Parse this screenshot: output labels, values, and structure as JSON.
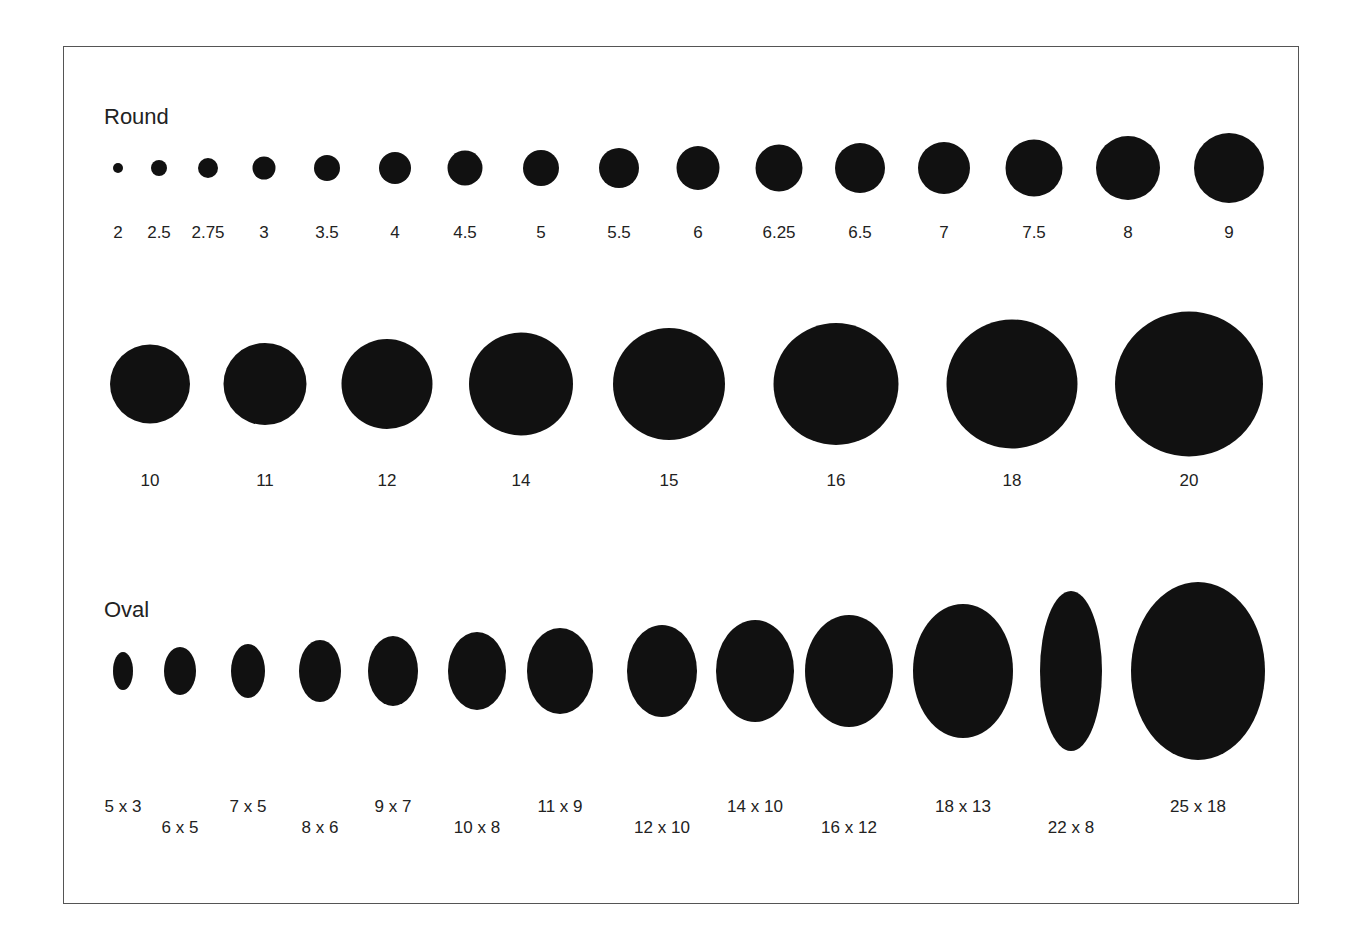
{
  "sections": {
    "round": {
      "title": "Round",
      "row1": [
        {
          "label": "2",
          "x": 118,
          "w": 10,
          "h": 10
        },
        {
          "label": "2.5",
          "x": 159,
          "w": 16,
          "h": 16
        },
        {
          "label": "2.75",
          "x": 208,
          "w": 20,
          "h": 20
        },
        {
          "label": "3",
          "x": 264,
          "w": 23,
          "h": 23
        },
        {
          "label": "3.5",
          "x": 327,
          "w": 26,
          "h": 26
        },
        {
          "label": "4",
          "x": 395,
          "w": 32,
          "h": 32
        },
        {
          "label": "4.5",
          "x": 465,
          "w": 35,
          "h": 35
        },
        {
          "label": "5",
          "x": 541,
          "w": 36,
          "h": 36
        },
        {
          "label": "5.5",
          "x": 619,
          "w": 40,
          "h": 40
        },
        {
          "label": "6",
          "x": 698,
          "w": 43,
          "h": 44
        },
        {
          "label": "6.25",
          "x": 779,
          "w": 47,
          "h": 47
        },
        {
          "label": "6.5",
          "x": 860,
          "w": 50,
          "h": 50
        },
        {
          "label": "7",
          "x": 944,
          "w": 52,
          "h": 52
        },
        {
          "label": "7.5",
          "x": 1034,
          "w": 57,
          "h": 57
        },
        {
          "label": "8",
          "x": 1128,
          "w": 64,
          "h": 64
        },
        {
          "label": "9",
          "x": 1229,
          "w": 70,
          "h": 70
        }
      ],
      "row2": [
        {
          "label": "10",
          "x": 150,
          "w": 80,
          "h": 79
        },
        {
          "label": "11",
          "x": 265,
          "w": 83,
          "h": 82
        },
        {
          "label": "12",
          "x": 387,
          "w": 91,
          "h": 90
        },
        {
          "label": "14",
          "x": 521,
          "w": 104,
          "h": 103
        },
        {
          "label": "15",
          "x": 669,
          "w": 112,
          "h": 112
        },
        {
          "label": "16",
          "x": 836,
          "w": 125,
          "h": 122
        },
        {
          "label": "18",
          "x": 1012,
          "w": 131,
          "h": 129
        },
        {
          "label": "20",
          "x": 1189,
          "w": 148,
          "h": 145
        }
      ]
    },
    "oval": {
      "title": "Oval",
      "items": [
        {
          "label": "5 x 3",
          "x": 123,
          "w": 20,
          "h": 38,
          "ly": 797
        },
        {
          "label": "6 x 5",
          "x": 180,
          "w": 32,
          "h": 48,
          "ly": 818
        },
        {
          "label": "7 x 5",
          "x": 248,
          "w": 34,
          "h": 54,
          "ly": 797
        },
        {
          "label": "8 x 6",
          "x": 320,
          "w": 42,
          "h": 62,
          "ly": 818
        },
        {
          "label": "9 x 7",
          "x": 393,
          "w": 50,
          "h": 70,
          "ly": 797
        },
        {
          "label": "10 x 8",
          "x": 477,
          "w": 58,
          "h": 78,
          "ly": 818
        },
        {
          "label": "11 x 9",
          "x": 560,
          "w": 66,
          "h": 86,
          "ly": 797
        },
        {
          "label": "12 x 10",
          "x": 662,
          "w": 70,
          "h": 92,
          "ly": 818
        },
        {
          "label": "14 x 10",
          "x": 755,
          "w": 78,
          "h": 102,
          "ly": 797
        },
        {
          "label": "16 x 12",
          "x": 849,
          "w": 88,
          "h": 112,
          "ly": 818
        },
        {
          "label": "18 x 13",
          "x": 963,
          "w": 100,
          "h": 134,
          "ly": 797
        },
        {
          "label": "22 x 8",
          "x": 1071,
          "w": 62,
          "h": 160,
          "ly": 818
        },
        {
          "label": "25 x 18",
          "x": 1198,
          "w": 134,
          "h": 178,
          "ly": 797
        }
      ]
    }
  }
}
